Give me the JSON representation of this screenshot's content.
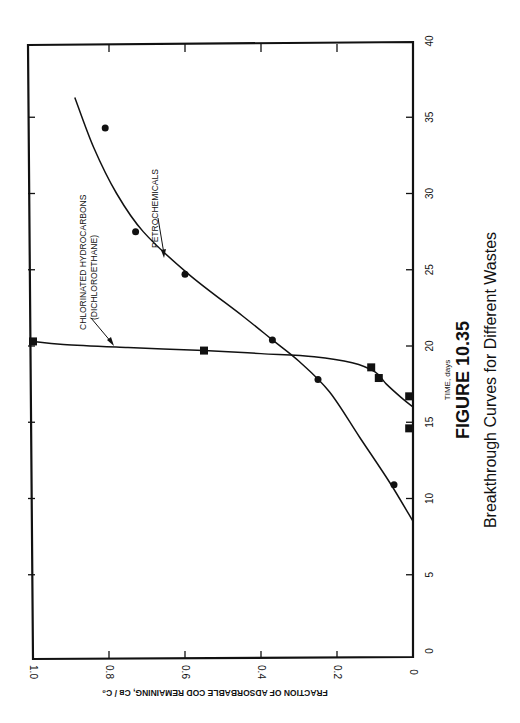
{
  "figure": {
    "number": "FIGURE 10.35",
    "caption": "Breakthrough Curves for Different Wastes"
  },
  "chart_data": {
    "type": "line",
    "title": "Breakthrough Curves for Different Wastes",
    "orientation": "rotated 90° counter-clockwise on page",
    "xlabel": "TIME, days",
    "ylabel": "FRACTION OF ADSORBABLE  COD REMAINING, C_B / C_0",
    "xlim": [
      0,
      40
    ],
    "ylim": [
      0,
      1.0
    ],
    "x_ticks": [
      "0",
      "5",
      "10",
      "15",
      "20",
      "25",
      "30",
      "35",
      "40"
    ],
    "y_ticks": [
      "0",
      "0.2",
      "0.4",
      "0.6",
      "0.8",
      "1.0"
    ],
    "grid": false,
    "series": [
      {
        "name": "PETROCHEMICALS",
        "marker": "circle",
        "points": [
          {
            "x": 10.9,
            "y": 0.05
          },
          {
            "x": 17.8,
            "y": 0.25
          },
          {
            "x": 20.4,
            "y": 0.37
          },
          {
            "x": 24.7,
            "y": 0.6
          },
          {
            "x": 27.5,
            "y": 0.73
          },
          {
            "x": 34.3,
            "y": 0.81
          }
        ],
        "curve": [
          [
            8.5,
            0
          ],
          [
            11,
            0.06
          ],
          [
            14,
            0.14
          ],
          [
            17,
            0.22
          ],
          [
            19,
            0.3
          ],
          [
            20.4,
            0.37
          ],
          [
            22,
            0.45
          ],
          [
            24.7,
            0.59
          ],
          [
            27.5,
            0.71
          ],
          [
            30,
            0.78
          ],
          [
            33,
            0.84
          ],
          [
            36.3,
            0.89
          ]
        ]
      },
      {
        "name": "CHLORINATED HYDROCARBONS (DICHLOROETHANE)",
        "marker": "square",
        "points": [
          {
            "x": 14.6,
            "y": 0.01
          },
          {
            "x": 16.7,
            "y": 0.01
          },
          {
            "x": 17.9,
            "y": 0.09
          },
          {
            "x": 18.6,
            "y": 0.11
          },
          {
            "x": 19.7,
            "y": 0.55
          },
          {
            "x": 20.3,
            "y": 1.0
          }
        ],
        "curve": [
          [
            16.0,
            0
          ],
          [
            16.6,
            0.03
          ],
          [
            17.5,
            0.07
          ],
          [
            18.3,
            0.1
          ],
          [
            18.9,
            0.16
          ],
          [
            19.3,
            0.26
          ],
          [
            19.5,
            0.4
          ],
          [
            19.7,
            0.55
          ],
          [
            19.9,
            0.75
          ],
          [
            20.1,
            0.92
          ],
          [
            20.3,
            1.0
          ]
        ]
      }
    ],
    "annotations": [
      {
        "text": "PETROCHEMICALS",
        "arrow_to": {
          "x": 26.0,
          "y": 0.66
        }
      },
      {
        "text": "CHLORINATED HYDROCARBONS",
        "text2": "(DICHLOROETHANE)",
        "arrow_to": {
          "x": 20.1,
          "y": 0.86
        }
      }
    ]
  }
}
